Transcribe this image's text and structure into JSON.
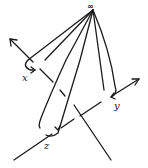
{
  "diagram": {
    "type": "hand-drawn loops from a basepoint at infinity around three strands",
    "basepoint": {
      "label": "∞",
      "x": 93,
      "y": 10
    },
    "loops": [
      {
        "label": "x",
        "label_pos": [
          22,
          74
        ]
      },
      {
        "label": "y",
        "label_pos": [
          114,
          104
        ]
      },
      {
        "label": "z",
        "label_pos": [
          44,
          143
        ]
      }
    ],
    "axes": [
      {
        "name": "line-1",
        "from": [
          111,
          160
        ],
        "to": [
          10,
          39
        ],
        "arrow": "upper-left"
      },
      {
        "name": "line-2",
        "from": [
          14,
          160
        ],
        "to": [
          139,
          79
        ],
        "arrow": "upper-right"
      }
    ],
    "colors": {
      "ink": "#1a1a1a",
      "background": "#ffffff"
    }
  }
}
